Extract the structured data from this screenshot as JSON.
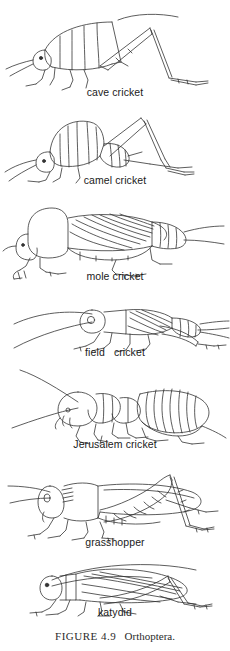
{
  "figure": {
    "plate_title_prefix": "FIGURE 4.9",
    "plate_title_subject": "Orthoptera.",
    "caption_full": "FIGURE 4.9   Orthoptera.",
    "background_color": "#ffffff",
    "ink_color": "#333333",
    "label_color": "#1a1a1a"
  },
  "specimens": [
    {
      "label": "cave cricket",
      "order": 1,
      "art_name": "cave-cricket-drawing"
    },
    {
      "label": "camel cricket",
      "order": 2,
      "art_name": "camel-cricket-drawing"
    },
    {
      "label": "mole cricket",
      "order": 3,
      "art_name": "mole-cricket-drawing"
    },
    {
      "label": "field   cricket",
      "order": 4,
      "art_name": "field-cricket-drawing"
    },
    {
      "label": "Jerusalem cricket",
      "order": 5,
      "art_name": "jerusalem-cricket-drawing"
    },
    {
      "label": "grasshopper",
      "order": 6,
      "art_name": "grasshopper-drawing"
    },
    {
      "label": "katydid",
      "order": 7,
      "art_name": "katydid-drawing"
    }
  ]
}
